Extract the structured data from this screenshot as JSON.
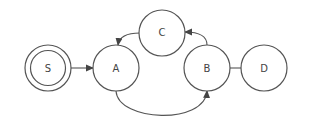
{
  "diagram": {
    "type": "state-machine",
    "colors": {
      "stroke": "#555555",
      "text": "#444444",
      "background": "#ffffff"
    },
    "nodes": [
      {
        "id": "S",
        "label": "S",
        "start": true
      },
      {
        "id": "A",
        "label": "A"
      },
      {
        "id": "C",
        "label": "C"
      },
      {
        "id": "B",
        "label": "B"
      },
      {
        "id": "D",
        "label": "D"
      }
    ],
    "edges": [
      {
        "from": "S",
        "to": "A"
      },
      {
        "from": "A",
        "to": "B"
      },
      {
        "from": "B",
        "to": "C"
      },
      {
        "from": "C",
        "to": "A"
      },
      {
        "from": "B",
        "to": "D"
      }
    ]
  }
}
